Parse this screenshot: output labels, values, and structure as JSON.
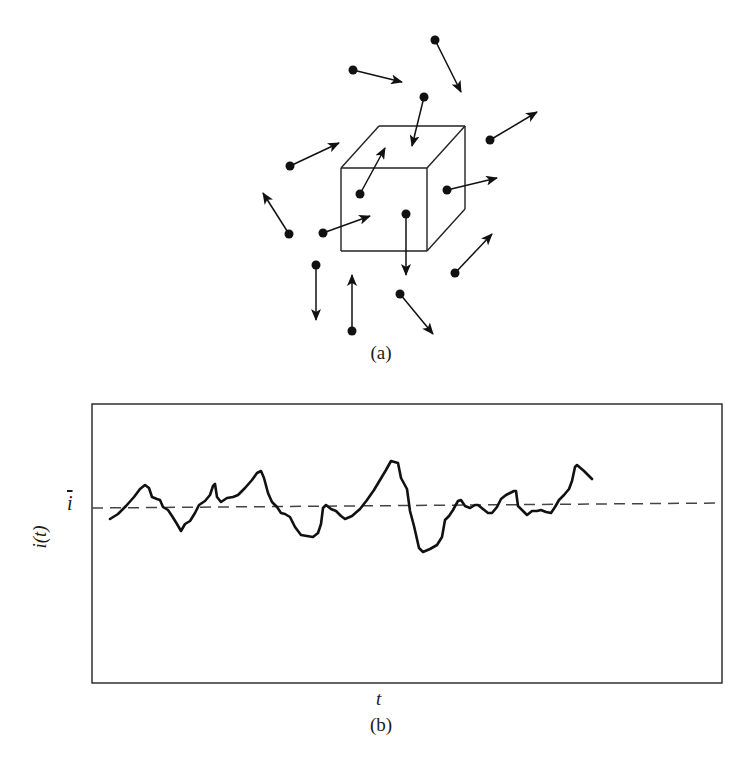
{
  "figure": {
    "panel_a": {
      "caption": "(a)",
      "description": "Charge carriers moving randomly in and around a volume element (cube)",
      "cube": {
        "front_face": {
          "x": 341,
          "y": 168,
          "w": 86,
          "h": 83
        },
        "depth_offset": {
          "dx": 38,
          "dy": -42
        }
      },
      "particles": [
        {
          "dot": [
            435,
            40
          ],
          "head": [
            461,
            92
          ]
        },
        {
          "dot": [
            353,
            70
          ],
          "head": [
            402,
            82
          ]
        },
        {
          "dot": [
            424,
            97
          ],
          "head": [
            412,
            146
          ]
        },
        {
          "dot": [
            490,
            140
          ],
          "head": [
            537,
            112
          ]
        },
        {
          "dot": [
            290,
            166
          ],
          "head": [
            339,
            143
          ]
        },
        {
          "dot": [
            360,
            194
          ],
          "head": [
            385,
            148
          ]
        },
        {
          "dot": [
            447,
            190
          ],
          "head": [
            497,
            178
          ]
        },
        {
          "dot": [
            289,
            234
          ],
          "head": [
            263,
            193
          ]
        },
        {
          "dot": [
            323,
            233
          ],
          "head": [
            370,
            216
          ]
        },
        {
          "dot": [
            406,
            214
          ],
          "head": [
            406,
            275
          ]
        },
        {
          "dot": [
            455,
            273
          ],
          "head": [
            492,
            234
          ]
        },
        {
          "dot": [
            316,
            265
          ],
          "head": [
            316,
            320
          ]
        },
        {
          "dot": [
            352,
            331
          ],
          "head": [
            352,
            275
          ]
        },
        {
          "dot": [
            400,
            294
          ],
          "head": [
            433,
            334
          ]
        }
      ]
    },
    "panel_b": {
      "caption": "(b)",
      "y_label": "i(t)",
      "x_label": "t",
      "mean_label": "i",
      "frame": {
        "x1": 92,
        "y1": 404,
        "x2": 722,
        "y2": 683
      },
      "mean_line_y": 505
    }
  },
  "chart_data": {
    "type": "line",
    "title": "",
    "xlabel": "t",
    "ylabel": "i(t)",
    "annotations": [
      "ī (mean current, dashed line)"
    ],
    "grid": false,
    "legend": null,
    "series": [
      {
        "name": "i(t)",
        "style": "solid",
        "points_px": [
          [
            110,
            519
          ],
          [
            118,
            514
          ],
          [
            126,
            506
          ],
          [
            134,
            497
          ],
          [
            140,
            489
          ],
          [
            145,
            485
          ],
          [
            149,
            488
          ],
          [
            152,
            497
          ],
          [
            157,
            499
          ],
          [
            160,
            500
          ],
          [
            163,
            507
          ],
          [
            168,
            510
          ],
          [
            172,
            516
          ],
          [
            177,
            524
          ],
          [
            181,
            531
          ],
          [
            185,
            524
          ],
          [
            190,
            521
          ],
          [
            195,
            513
          ],
          [
            199,
            505
          ],
          [
            205,
            501
          ],
          [
            210,
            495
          ],
          [
            213,
            486
          ],
          [
            215,
            484
          ],
          [
            217,
            497
          ],
          [
            221,
            502
          ],
          [
            227,
            498
          ],
          [
            233,
            497
          ],
          [
            238,
            495
          ],
          [
            245,
            488
          ],
          [
            252,
            480
          ],
          [
            257,
            473
          ],
          [
            261,
            471
          ],
          [
            264,
            478
          ],
          [
            268,
            493
          ],
          [
            272,
            502
          ],
          [
            277,
            507
          ],
          [
            281,
            513
          ],
          [
            285,
            514
          ],
          [
            290,
            517
          ],
          [
            295,
            527
          ],
          [
            301,
            535
          ],
          [
            307,
            536
          ],
          [
            313,
            537
          ],
          [
            318,
            533
          ],
          [
            321,
            524
          ],
          [
            323,
            508
          ],
          [
            326,
            505
          ],
          [
            331,
            509
          ],
          [
            336,
            511
          ],
          [
            341,
            516
          ],
          [
            345,
            519
          ],
          [
            352,
            516
          ],
          [
            360,
            509
          ],
          [
            367,
            500
          ],
          [
            374,
            490
          ],
          [
            380,
            480
          ],
          [
            386,
            470
          ],
          [
            391,
            461
          ],
          [
            398,
            463
          ],
          [
            401,
            478
          ],
          [
            407,
            489
          ],
          [
            410,
            511
          ],
          [
            414,
            526
          ],
          [
            419,
            548
          ],
          [
            423,
            552
          ],
          [
            430,
            549
          ],
          [
            437,
            545
          ],
          [
            442,
            537
          ],
          [
            445,
            520
          ],
          [
            449,
            516
          ],
          [
            453,
            510
          ],
          [
            458,
            501
          ],
          [
            461,
            500
          ],
          [
            465,
            506
          ],
          [
            470,
            508
          ],
          [
            475,
            505
          ],
          [
            478,
            505
          ],
          [
            483,
            509
          ],
          [
            488,
            513
          ],
          [
            492,
            513
          ],
          [
            497,
            507
          ],
          [
            501,
            499
          ],
          [
            506,
            495
          ],
          [
            514,
            491
          ],
          [
            516,
            491
          ],
          [
            518,
            506
          ],
          [
            523,
            511
          ],
          [
            527,
            515
          ],
          [
            532,
            511
          ],
          [
            537,
            511
          ],
          [
            541,
            510
          ],
          [
            546,
            512
          ],
          [
            551,
            513
          ],
          [
            555,
            507
          ],
          [
            559,
            500
          ],
          [
            564,
            495
          ],
          [
            569,
            489
          ],
          [
            572,
            481
          ],
          [
            575,
            467
          ],
          [
            577,
            465
          ],
          [
            584,
            471
          ],
          [
            592,
            479
          ]
        ]
      },
      {
        "name": "mean (ī)",
        "style": "dashed",
        "points_px": [
          [
            92,
            508
          ],
          [
            722,
            503
          ]
        ]
      }
    ]
  }
}
